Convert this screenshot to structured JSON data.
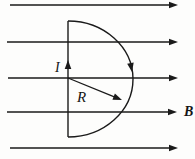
{
  "figure": {
    "colors": {
      "background": "#fdfdfc",
      "ink": "#1a1a1a"
    },
    "field": {
      "label": "B",
      "label_pos": {
        "x": 184,
        "y": 116
      },
      "direction": "right",
      "line_count": 5,
      "lines": [
        {
          "y": 5,
          "x1": 10,
          "x2": 178
        },
        {
          "y": 42,
          "x1": 7,
          "x2": 178
        },
        {
          "y": 78,
          "x1": 8,
          "x2": 178
        },
        {
          "y": 112,
          "x1": 7,
          "x2": 177
        },
        {
          "y": 148,
          "x1": 10,
          "x2": 178
        }
      ]
    },
    "loop": {
      "current_label": "I",
      "current_label_pos": {
        "x": 55,
        "y": 72
      },
      "radius_label": "R",
      "radius_label_pos": {
        "x": 77,
        "y": 102
      },
      "diameter": {
        "x": 68,
        "y_top": 21,
        "y_bottom": 137
      },
      "arc": {
        "rx": 65,
        "ry": 58
      },
      "current_arrow": {
        "x": 68,
        "y": 60,
        "angle": -90
      },
      "arc_arrow": {
        "x": 132,
        "y": 72,
        "angle": 80
      },
      "radius_arrow": {
        "x1": 68,
        "y1": 78,
        "x2": 122,
        "y2": 100
      }
    }
  }
}
